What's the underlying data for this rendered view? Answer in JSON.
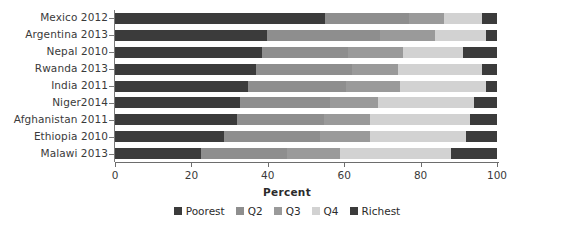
{
  "chart_data": {
    "type": "bar",
    "orientation": "horizontal",
    "stacked": true,
    "title": "",
    "xlabel": "Percent",
    "ylabel": "",
    "xlim": [
      0,
      100
    ],
    "xticks": [
      0,
      20,
      40,
      60,
      80,
      100
    ],
    "grid": false,
    "legend_position": "bottom-center",
    "categories": [
      "Mexico 2012",
      "Argentina 2013",
      "Nepal 2010",
      "Rwanda 2013",
      "India 2011",
      "Niger2014",
      "Afghanistan 2011",
      "Ethiopia 2010",
      "Malawi 2013"
    ],
    "series": [
      {
        "name": "Poorest",
        "color": "#3b3b3b",
        "values": [
          55.0,
          39.8,
          38.6,
          36.8,
          34.8,
          32.6,
          31.9,
          28.5,
          22.5
        ]
      },
      {
        "name": "Q2",
        "color": "#8e8e8e",
        "values": [
          22.0,
          29.6,
          22.5,
          25.2,
          25.7,
          23.8,
          22.8,
          25.2,
          22.5
        ]
      },
      {
        "name": "Q3",
        "color": "#9a9a9a",
        "values": [
          9.0,
          14.5,
          14.4,
          12.0,
          14.0,
          12.5,
          12.0,
          13.0,
          14.0
        ]
      },
      {
        "name": "Q4",
        "color": "#d2d2d2",
        "values": [
          10.0,
          13.1,
          15.7,
          22.0,
          22.5,
          25.1,
          26.3,
          25.3,
          29.0
        ]
      },
      {
        "name": "Richest",
        "color": "#3b3b3b",
        "values": [
          4.0,
          3.0,
          8.8,
          4.0,
          3.0,
          6.0,
          7.0,
          8.0,
          12.0
        ]
      }
    ]
  },
  "legend": {
    "items": [
      {
        "label": "Poorest",
        "color": "#3b3b3b"
      },
      {
        "label": "Q2",
        "color": "#8e8e8e"
      },
      {
        "label": "Q3",
        "color": "#9a9a9a"
      },
      {
        "label": "Q4",
        "color": "#d2d2d2"
      },
      {
        "label": "Richest",
        "color": "#3b3b3b"
      }
    ]
  },
  "axes": {
    "x_label": "Percent",
    "x_tick_labels": [
      "0",
      "20",
      "40",
      "60",
      "80",
      "100"
    ]
  }
}
